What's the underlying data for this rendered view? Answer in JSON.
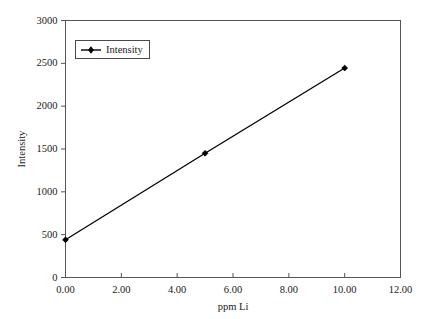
{
  "chart_data": {
    "type": "line",
    "title": "",
    "xlabel": "ppm Li",
    "ylabel": "Intensity",
    "xlim": [
      0,
      12
    ],
    "ylim": [
      0,
      3000
    ],
    "xticks": [
      "0.00",
      "2.00",
      "4.00",
      "6.00",
      "8.00",
      "10.00",
      "12.00"
    ],
    "xtick_values": [
      0,
      2,
      4,
      6,
      8,
      10,
      12
    ],
    "yticks": [
      "0",
      "500",
      "1000",
      "1500",
      "2000",
      "2500",
      "3000"
    ],
    "ytick_values": [
      0,
      500,
      1000,
      1500,
      2000,
      2500,
      3000
    ],
    "grid": false,
    "legend": {
      "position": "top-left",
      "entries": [
        {
          "name": "Intensity",
          "marker": "diamond-line-marker",
          "color": "#000000"
        }
      ]
    },
    "series": [
      {
        "name": "Intensity",
        "color": "#000000",
        "marker": "diamond",
        "x": [
          0,
          5,
          10
        ],
        "values": [
          440,
          1450,
          2445
        ]
      }
    ]
  },
  "axes": {
    "frame_color": "#555555",
    "line_color": "#000000"
  }
}
